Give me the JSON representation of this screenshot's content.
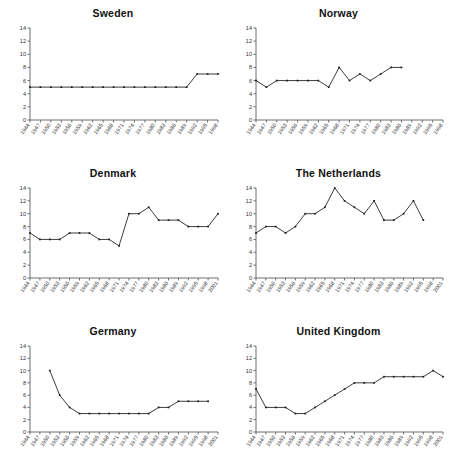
{
  "figure": {
    "caption": "",
    "panel_count": 6
  },
  "axes": {
    "y_ticks": [
      0,
      2,
      4,
      6,
      8,
      10,
      12,
      14
    ],
    "ylim": [
      0,
      14
    ],
    "x_ticks": [
      "1944",
      "1947",
      "1950",
      "1953",
      "1956",
      "1959",
      "1962",
      "1965",
      "1968",
      "1971",
      "1974",
      "1977",
      "1980",
      "1983",
      "1986",
      "1989",
      "1992",
      "1995",
      "1998",
      "2001"
    ],
    "grid": false,
    "legend": "none"
  },
  "chart_data": [
    {
      "type": "line",
      "title": "Sweden",
      "xlabel": "",
      "ylabel": "",
      "ylim": [
        0,
        14
      ],
      "x": [
        "1944",
        "1947",
        "1950",
        "1953",
        "1956",
        "1959",
        "1962",
        "1965",
        "1968",
        "1971",
        "1974",
        "1977",
        "1980",
        "1983",
        "1986",
        "1989",
        "1992",
        "1995",
        "1998"
      ],
      "values": [
        5,
        5,
        5,
        5,
        5,
        5,
        5,
        5,
        5,
        5,
        5,
        5,
        5,
        5,
        5,
        5,
        7,
        7,
        7
      ],
      "x_ticks": [
        "1944",
        "1947",
        "1950",
        "1953",
        "1956",
        "1959",
        "1962",
        "1965",
        "1968",
        "1971",
        "1974",
        "1977",
        "1980",
        "1983",
        "1986",
        "1989",
        "1992",
        "1995",
        "1998"
      ]
    },
    {
      "type": "line",
      "title": "Norway",
      "xlabel": "",
      "ylabel": "",
      "ylim": [
        0,
        14
      ],
      "x": [
        "1944",
        "1947",
        "1950",
        "1953",
        "1956",
        "1959",
        "1962",
        "1965",
        "1968",
        "1971",
        "1974",
        "1977",
        "1980",
        "1983",
        "1986",
        "1989",
        "1992",
        "1995",
        "1998"
      ],
      "values": [
        6,
        5,
        6,
        6,
        6,
        6,
        6,
        5,
        8,
        6,
        7,
        6,
        7,
        8,
        8,
        null,
        null,
        null,
        null
      ],
      "x_ticks": [
        "1944",
        "1947",
        "1950",
        "1953",
        "1956",
        "1959",
        "1962",
        "1965",
        "1968",
        "1971",
        "1974",
        "1977",
        "1980",
        "1983",
        "1986",
        "1989",
        "1992",
        "1995",
        "1998"
      ]
    },
    {
      "type": "line",
      "title": "Denmark",
      "xlabel": "",
      "ylabel": "",
      "ylim": [
        0,
        14
      ],
      "x": [
        "1944",
        "1947",
        "1950",
        "1953",
        "1956",
        "1959",
        "1962",
        "1965",
        "1968",
        "1971",
        "1974",
        "1977",
        "1980",
        "1983",
        "1986",
        "1989",
        "1992",
        "1995",
        "1998",
        "2001"
      ],
      "values": [
        7,
        6,
        6,
        6,
        7,
        7,
        7,
        6,
        6,
        5,
        10,
        10,
        11,
        9,
        9,
        9,
        8,
        8,
        8,
        10
      ],
      "x_ticks": [
        "1944",
        "1947",
        "1950",
        "1953",
        "1956",
        "1959",
        "1962",
        "1965",
        "1968",
        "1971",
        "1974",
        "1977",
        "1980",
        "1983",
        "1986",
        "1989",
        "1992",
        "1995",
        "1998",
        "2001"
      ]
    },
    {
      "type": "line",
      "title": "The Netherlands",
      "xlabel": "",
      "ylabel": "",
      "ylim": [
        0,
        14
      ],
      "x": [
        "1944",
        "1947",
        "1950",
        "1953",
        "1956",
        "1959",
        "1962",
        "1965",
        "1968",
        "1971",
        "1974",
        "1977",
        "1980",
        "1983",
        "1986",
        "1989",
        "1992",
        "1995",
        "1998",
        "2001"
      ],
      "values": [
        7,
        8,
        8,
        7,
        8,
        10,
        10,
        11,
        14,
        12,
        11,
        10,
        12,
        9,
        9,
        10,
        12,
        9,
        null,
        null
      ],
      "x_ticks": [
        "1944",
        "1947",
        "1950",
        "1953",
        "1956",
        "1959",
        "1962",
        "1965",
        "1968",
        "1971",
        "1974",
        "1977",
        "1980",
        "1983",
        "1986",
        "1989",
        "1992",
        "1995",
        "1998",
        "2001"
      ]
    },
    {
      "type": "line",
      "title": "Germany",
      "xlabel": "",
      "ylabel": "",
      "ylim": [
        0,
        14
      ],
      "x": [
        "1944",
        "1947",
        "1950",
        "1953",
        "1956",
        "1959",
        "1962",
        "1965",
        "1968",
        "1971",
        "1974",
        "1977",
        "1980",
        "1983",
        "1986",
        "1989",
        "1992",
        "1995",
        "1998",
        "2001"
      ],
      "values": [
        null,
        null,
        10,
        6,
        4,
        3,
        3,
        3,
        3,
        3,
        3,
        3,
        3,
        4,
        4,
        5,
        5,
        5,
        5,
        null
      ],
      "x_ticks": [
        "1944",
        "1947",
        "1950",
        "1953",
        "1956",
        "1959",
        "1962",
        "1965",
        "1968",
        "1971",
        "1974",
        "1977",
        "1980",
        "1983",
        "1986",
        "1989",
        "1992",
        "1995",
        "1998",
        "2001"
      ]
    },
    {
      "type": "line",
      "title": "United Kingdom",
      "xlabel": "",
      "ylabel": "",
      "ylim": [
        0,
        14
      ],
      "x": [
        "1944",
        "1947",
        "1950",
        "1953",
        "1956",
        "1959",
        "1962",
        "1965",
        "1968",
        "1971",
        "1974",
        "1977",
        "1980",
        "1983",
        "1986",
        "1989",
        "1992",
        "1995",
        "1998",
        "2001"
      ],
      "values": [
        7,
        4,
        4,
        4,
        3,
        3,
        4,
        5,
        6,
        7,
        8,
        8,
        8,
        9,
        9,
        9,
        9,
        9,
        10,
        9
      ],
      "x_ticks": [
        "1944",
        "1947",
        "1950",
        "1953",
        "1956",
        "1959",
        "1962",
        "1965",
        "1968",
        "1971",
        "1974",
        "1977",
        "1980",
        "1983",
        "1986",
        "1989",
        "1992",
        "1995",
        "1998",
        "2001"
      ]
    }
  ]
}
